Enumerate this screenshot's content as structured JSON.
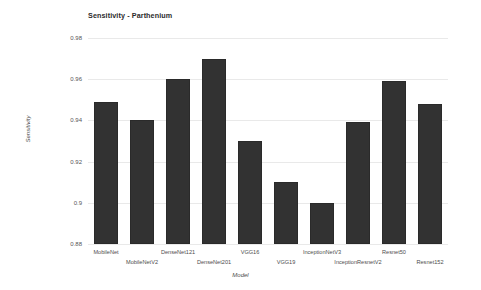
{
  "chart_data": {
    "type": "bar",
    "title": "Sensitivity - Parthenium",
    "xlabel": "Model",
    "ylabel": "Sensitivity",
    "ylim": [
      0.88,
      0.98
    ],
    "yticks": [
      "0.98",
      "0.96",
      "0.94",
      "0.92",
      "0.9",
      "0.88"
    ],
    "ytick_values": [
      0.98,
      0.96,
      0.94,
      0.92,
      0.9,
      0.88
    ],
    "grid": true,
    "legend": "none",
    "bar_color": "#323232",
    "categories": [
      "MobileNet",
      "MobileNetV2",
      "DenseNet121",
      "DenseNet201",
      "VGG16",
      "VGG19",
      "InceptionNetV3",
      "InceptionResnetV2",
      "Resnet50",
      "Resnet152"
    ],
    "values": [
      0.949,
      0.94,
      0.96,
      0.97,
      0.93,
      0.91,
      0.9,
      0.939,
      0.959,
      0.948
    ]
  }
}
